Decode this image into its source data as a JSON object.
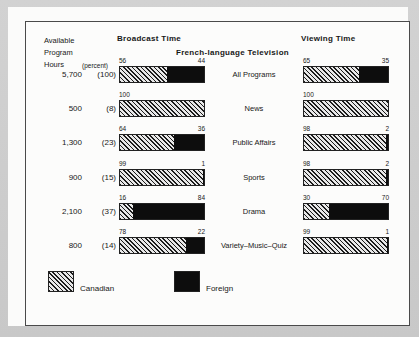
{
  "chart_data": {
    "type": "bar",
    "title": "French-language Television",
    "subtitle": "",
    "orientation": "horizontal",
    "stacked": true,
    "units": "percent",
    "xlabel": "",
    "ylabel": "",
    "xlim": [
      0,
      100
    ],
    "grid": false,
    "legend_position": "bottom-left",
    "panels": [
      {
        "key": "broadcast",
        "header": "Broadcast  Time"
      },
      {
        "key": "viewing",
        "header": "Viewing  Time"
      }
    ],
    "series": [
      {
        "name": "Canadian",
        "color": "#1c1c1c",
        "fill": "diagonal-hatch"
      },
      {
        "name": "Foreign",
        "color": "#0d0d0d",
        "fill": "solid"
      }
    ],
    "left_columns": {
      "header_line1": "Available",
      "header_line2": "Program",
      "header_line3": "Hours",
      "percent_header": "(percent)"
    },
    "categories": [
      "All Programs",
      "News",
      "Public Affairs",
      "Sports",
      "Drama",
      "Variety–Music–Quiz"
    ],
    "rows": [
      {
        "label": "All Programs",
        "hours": "5,700",
        "percent": "(100)",
        "broadcast": {
          "canadian": 56,
          "foreign": 44
        },
        "viewing": {
          "canadian": 65,
          "foreign": 35
        }
      },
      {
        "label": "News",
        "hours": "500",
        "percent": "(8)",
        "broadcast": {
          "canadian": 100,
          "foreign": 0
        },
        "viewing": {
          "canadian": 100,
          "foreign": 0
        }
      },
      {
        "label": "Public Affairs",
        "hours": "1,300",
        "percent": "(23)",
        "broadcast": {
          "canadian": 64,
          "foreign": 36
        },
        "viewing": {
          "canadian": 98,
          "foreign": 2
        }
      },
      {
        "label": "Sports",
        "hours": "900",
        "percent": "(15)",
        "broadcast": {
          "canadian": 99,
          "foreign": 1
        },
        "viewing": {
          "canadian": 98,
          "foreign": 2
        }
      },
      {
        "label": "Drama",
        "hours": "2,100",
        "percent": "(37)",
        "broadcast": {
          "canadian": 16,
          "foreign": 84
        },
        "viewing": {
          "canadian": 30,
          "foreign": 70
        }
      },
      {
        "label": "Variety–Music–Quiz",
        "hours": "800",
        "percent": "(14)",
        "broadcast": {
          "canadian": 78,
          "foreign": 22
        },
        "viewing": {
          "canadian": 99,
          "foreign": 1
        }
      }
    ],
    "legend": [
      {
        "label": "Canadian",
        "fill": "diagonal-hatch"
      },
      {
        "label": "Foreign",
        "fill": "solid"
      }
    ]
  }
}
